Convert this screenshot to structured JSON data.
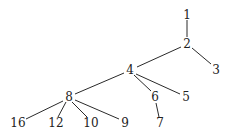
{
  "diagram": {
    "type": "tree",
    "nodes": [
      {
        "id": "1",
        "label": "1",
        "x": 187,
        "y": 15
      },
      {
        "id": "2",
        "label": "2",
        "x": 187,
        "y": 44
      },
      {
        "id": "3",
        "label": "3",
        "x": 216,
        "y": 70
      },
      {
        "id": "4",
        "label": "4",
        "x": 130,
        "y": 70
      },
      {
        "id": "5",
        "label": "5",
        "x": 186,
        "y": 97
      },
      {
        "id": "6",
        "label": "6",
        "x": 155,
        "y": 97
      },
      {
        "id": "7",
        "label": "7",
        "x": 160,
        "y": 123
      },
      {
        "id": "8",
        "label": "8",
        "x": 69,
        "y": 97
      },
      {
        "id": "9",
        "label": "9",
        "x": 125,
        "y": 123
      },
      {
        "id": "10",
        "label": "10",
        "x": 91,
        "y": 123
      },
      {
        "id": "12",
        "label": "12",
        "x": 56,
        "y": 123
      },
      {
        "id": "16",
        "label": "16",
        "x": 18,
        "y": 123
      }
    ],
    "edges": [
      {
        "from": "1",
        "to": "2",
        "x1": 187,
        "y1": 20,
        "x2": 187,
        "y2": 37
      },
      {
        "from": "2",
        "to": "3",
        "x1": 192,
        "y1": 48,
        "x2": 211,
        "y2": 64
      },
      {
        "from": "2",
        "to": "4",
        "x1": 181,
        "y1": 47,
        "x2": 137,
        "y2": 67
      },
      {
        "from": "4",
        "to": "5",
        "x1": 136,
        "y1": 74,
        "x2": 180,
        "y2": 94
      },
      {
        "from": "4",
        "to": "6",
        "x1": 134,
        "y1": 75,
        "x2": 151,
        "y2": 91
      },
      {
        "from": "6",
        "to": "7",
        "x1": 156,
        "y1": 103,
        "x2": 159,
        "y2": 117
      },
      {
        "from": "4",
        "to": "8",
        "x1": 124,
        "y1": 73,
        "x2": 75,
        "y2": 94
      },
      {
        "from": "8",
        "to": "16",
        "x1": 63,
        "y1": 101,
        "x2": 26,
        "y2": 119
      },
      {
        "from": "8",
        "to": "12",
        "x1": 66,
        "y1": 102,
        "x2": 58,
        "y2": 117
      },
      {
        "from": "8",
        "to": "10",
        "x1": 72,
        "y1": 102,
        "x2": 87,
        "y2": 117
      },
      {
        "from": "8",
        "to": "9",
        "x1": 75,
        "y1": 100,
        "x2": 119,
        "y2": 119
      }
    ]
  }
}
